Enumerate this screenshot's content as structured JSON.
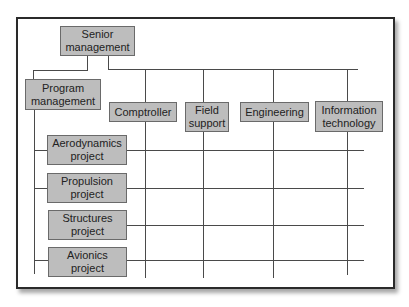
{
  "diagram": {
    "type": "matrix-organization-chart",
    "top": {
      "label": "Senior\nmanagement"
    },
    "program": {
      "label": "Program\nmanagement"
    },
    "functional": [
      {
        "label": "Comptroller"
      },
      {
        "label": "Field\nsupport"
      },
      {
        "label": "Engineering"
      },
      {
        "label": "Information\ntechnology"
      }
    ],
    "projects": [
      {
        "label": "Aerodynamics\nproject"
      },
      {
        "label": "Propulsion\nproject"
      },
      {
        "label": "Structures\nproject"
      },
      {
        "label": "Avionics\nproject"
      }
    ],
    "colors": {
      "box_fill": "#bdbdbd",
      "box_border": "#6a6a6a",
      "line": "#4a4a4a",
      "frame_border": "#2a2a2a"
    }
  }
}
